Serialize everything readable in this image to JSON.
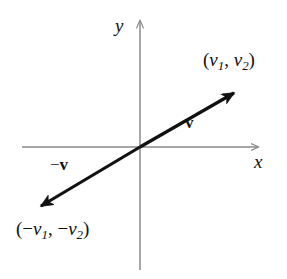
{
  "figure": {
    "background_color": "#ffffff",
    "width": 287,
    "height": 279
  },
  "axes": {
    "color": "#8a8a8a",
    "x_axis": {
      "label": "x",
      "y_position": 147,
      "x_start": 22,
      "x_end": 262,
      "arrow": "right"
    },
    "y_axis": {
      "label": "y",
      "x_position": 140,
      "y_start": 270,
      "y_end": 17,
      "arrow": "up"
    },
    "origin": {
      "x": 140,
      "y": 147
    }
  },
  "vector": {
    "color": "#111111",
    "stroke_width": 3.2,
    "head": {
      "name": "v",
      "label_prefix": "",
      "label_symbol": "v",
      "tip": {
        "x": 240,
        "y": 88
      },
      "point_label": {
        "open_paren": "(",
        "first_var": "v",
        "first_sub": "1",
        "comma": ", ",
        "second_var": "v",
        "second_sub": "2",
        "close_paren": ")"
      }
    },
    "tail": {
      "name": "-v",
      "label_prefix": "−",
      "label_symbol": "v",
      "tip": {
        "x": 33,
        "y": 212
      },
      "point_label": {
        "open_paren": "(",
        "minus_one": "−",
        "first_var": "v",
        "first_sub": "1",
        "comma": ", ",
        "minus_two": "−",
        "second_var": "v",
        "second_sub": "2",
        "close_paren": ")"
      }
    }
  }
}
